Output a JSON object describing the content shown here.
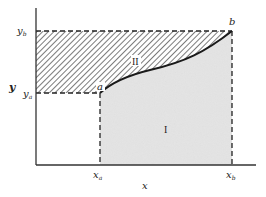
{
  "figure": {
    "type": "integration-by-parts area diagram",
    "axes": {
      "x_label": "x",
      "y_label": "y"
    },
    "ticks": {
      "x_a": "x",
      "x_a_sub": "a",
      "x_b": "x",
      "x_b_sub": "b",
      "y_a": "y",
      "y_a_sub": "a",
      "y_b": "y",
      "y_b_sub": "b"
    },
    "points": {
      "a": "a",
      "b": "b"
    },
    "regions": {
      "region_I": {
        "label": "I",
        "fill": "#e2e2e2",
        "style": "stippled gray"
      },
      "region_II": {
        "label": "II",
        "fill": "hatched",
        "style": "diagonal hatching"
      }
    },
    "colors": {
      "ink": "#222222",
      "shade": "#e2e2e2",
      "background": "#ffffff"
    }
  }
}
